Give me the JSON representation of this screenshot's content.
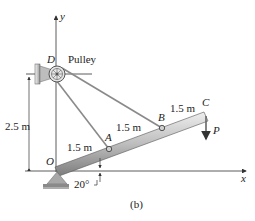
{
  "figure": {
    "caption": "(b)",
    "axes": {
      "x_label": "x",
      "y_label": "y"
    },
    "points": {
      "O": "O",
      "A": "A",
      "B": "B",
      "C": "C",
      "D": "D"
    },
    "pulley_label": "Pulley",
    "load_label": "P",
    "dimensions": {
      "height": "2.5 m",
      "OA": "1.5 m",
      "AB": "1.5 m",
      "BC": "1.5 m",
      "angle": "20°"
    },
    "colors": {
      "beam_light": "#d9d9d9",
      "beam_dark": "#8c8c8c",
      "cable": "#8a8a8a",
      "line": "#333333",
      "support": "#a8a8a8"
    }
  }
}
